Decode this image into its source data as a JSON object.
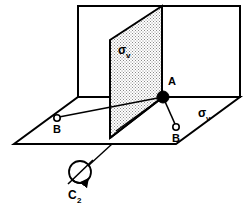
{
  "figure": {
    "background_color": "#ffffff",
    "line_color": "#000000",
    "shaded_plane_fill": "#d9d9d9",
    "open_plane_fill": "#ffffff"
  },
  "labels": {
    "atom_a": "A",
    "atom_b_left": "B",
    "atom_b_right": "B",
    "sigma_front": "σ",
    "sigma_front_sub": "v",
    "sigma_right": "σ",
    "sigma_right_sub": "v",
    "axis_c2": "C",
    "axis_c2_sub": "2"
  },
  "elements": {
    "center_atom": {
      "name": "A",
      "style": "filled-circle",
      "x": 163,
      "y": 97,
      "r": 6
    },
    "left_atom": {
      "name": "B",
      "style": "open-circle",
      "x": 57,
      "y": 118,
      "r": 3
    },
    "right_atom": {
      "name": "B",
      "style": "open-circle",
      "x": 176,
      "y": 127,
      "r": 3
    },
    "rotation_symbol": {
      "name": "C2",
      "style": "circle-with-axis-and-curved-arrow",
      "x": 80,
      "y": 172,
      "r": 11
    },
    "dashed_axis": {
      "from_x": 163,
      "from_y": 97,
      "to_x": 233,
      "to_y": 97,
      "style": "dashed"
    }
  }
}
